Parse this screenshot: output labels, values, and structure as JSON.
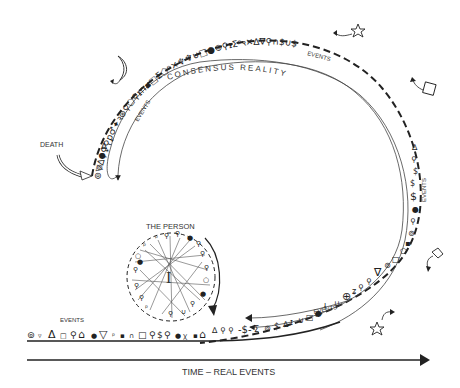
{
  "labels": {
    "consensus_reality": "CONSENSUS REALITY",
    "events_top": "EVENTS",
    "events_topright": "EVENTS",
    "events_right": "EVENTS",
    "events_bottomarc": "EVENTS",
    "events_bottomline": "EVENTS",
    "death": "DEATH",
    "the_person": "THE PERSON",
    "person_center": "I",
    "time_axis": "TIME – REAL EVENTS"
  },
  "symbols": {
    "top_arc": "⊚▽∆⚲♀⚲ꝑ♂✦ꝛ⊛⚲⬠⚲ᵻ∩▪□Σ⬠ᵖ✕♆♆∪□●⊚⚲ᵻΣᵖꝛ✕∆∇⚲∩$∪$",
    "right_arc": "⚲●≠⚲⚲●▪□⬠⊚∇",
    "bottom_arc": "⚲ʑꝁ⊕∪ⱡ●□∪ᵻ∆$⊚Σ$⚲⚲∆",
    "bottom_line": "⊚▿Δ□⚲⌂●▽ᵖ▪∩□⚲$⚲●ꭓ▪⌂∆⚲⚲",
    "person_ring": "ᵖ⚲⚲●⚲ᵖ⚲⚲○●⚲⚲●⚲∪⚲ᵖ⚲▪○ᵖ"
  },
  "icons": {
    "moon": "moon-icon",
    "star_top": "star-icon",
    "square": "square-icon",
    "house": "house-icon",
    "star_bottom": "star-icon"
  }
}
